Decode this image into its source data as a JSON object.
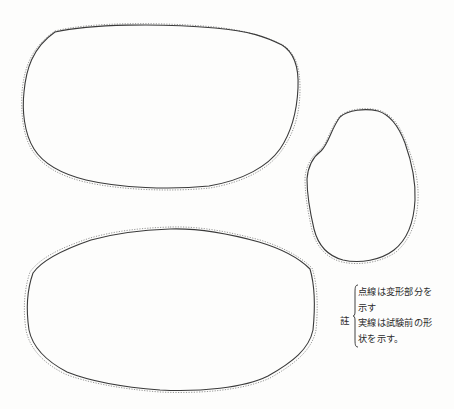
{
  "figure": {
    "shapes": [
      {
        "id": "upper-left-specimen",
        "description": "large rounded-rectangular outline, top left"
      },
      {
        "id": "right-specimen",
        "description": "small oval outline, right middle"
      },
      {
        "id": "lower-left-specimen",
        "description": "large elliptical outline, bottom left"
      }
    ],
    "line_styles": {
      "solid_color": "#3a3a3a",
      "dotted_color": "#8a8a8a"
    }
  },
  "note": {
    "label": "註",
    "lines": [
      "点線は変形部分を",
      "示す",
      "実線は試験前の形",
      "状を示す。"
    ]
  }
}
